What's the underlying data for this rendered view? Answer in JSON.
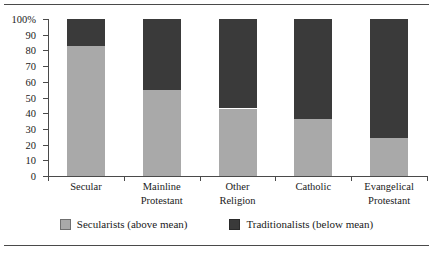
{
  "chart_data": {
    "type": "bar",
    "stacked": true,
    "orientation": "vertical",
    "title": "",
    "subtitle": "",
    "xlabel": "",
    "ylabel": "",
    "ylim": [
      0,
      100
    ],
    "yticks": [
      "0",
      "10",
      "20",
      "30",
      "40",
      "50",
      "60",
      "70",
      "80",
      "90",
      "100%"
    ],
    "ytick_values": [
      0,
      10,
      20,
      30,
      40,
      50,
      60,
      70,
      80,
      90,
      100
    ],
    "grid": false,
    "legend_position": "bottom",
    "categories": [
      "Secular",
      "Mainline Protestant",
      "Other Religion",
      "Catholic",
      "Evangelical Protestant"
    ],
    "category_lines": [
      [
        "Secular"
      ],
      [
        "Mainline",
        "Protestant"
      ],
      [
        "Other",
        "Religion"
      ],
      [
        "Catholic"
      ],
      [
        "Evangelical",
        "Protestant"
      ]
    ],
    "series": [
      {
        "name": "Secularists (above mean)",
        "color": "#a9a9a9",
        "values": [
          83,
          55,
          43,
          36,
          24
        ]
      },
      {
        "name": "Traditionalists (below mean)",
        "color": "#3a3a3a",
        "values": [
          17,
          45,
          57,
          64,
          76
        ]
      }
    ]
  },
  "legend": {
    "items": [
      {
        "label": "Secularists (above mean)"
      },
      {
        "label": "Traditionalists (below mean)"
      }
    ]
  },
  "colors": {
    "secularists": "#a9a9a9",
    "traditionalists": "#3a3a3a",
    "axis": "#4a4a4a",
    "text": "#1a1a1a",
    "background": "#ffffff"
  }
}
